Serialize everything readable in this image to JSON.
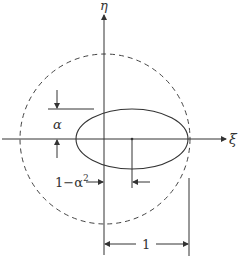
{
  "diagram": {
    "type": "geometry",
    "axes": {
      "horizontal_label": "ξ",
      "vertical_label": "η"
    },
    "labels": {
      "alpha": "α",
      "offset": "1−α",
      "offset_exp": "2",
      "unit_length": "1"
    },
    "colors": {
      "stroke": "#333333",
      "background": "#ffffff"
    }
  }
}
